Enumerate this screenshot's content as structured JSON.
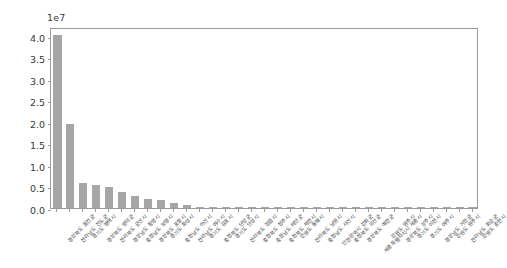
{
  "chart_data": {
    "type": "bar",
    "title": "",
    "xlabel": "",
    "ylabel": "",
    "offset_text": "1e7",
    "scale_factor": 10000000,
    "ylim": [
      0.0,
      4.2
    ],
    "ytick_labels": [
      "0.0",
      "0.5",
      "1.0",
      "1.5",
      "2.0",
      "2.5",
      "3.0",
      "3.5",
      "4.0"
    ],
    "ytick_values": [
      0.0,
      0.5,
      1.0,
      1.5,
      2.0,
      2.5,
      3.0,
      3.5,
      4.0
    ],
    "grid": false,
    "legend": null,
    "bar_color": "#a6a6a6",
    "frame_color": "#9a9a9a",
    "tick_label_color": "#3a3a3a",
    "xtick_rotation": -45,
    "categories": [
      "경상북도 울진군",
      "전라남도 진도군",
      "경기도 평택시",
      "경상북도 영덕군",
      "전라북도 군산시",
      "경상남도 통영시",
      "충청남도 보령시",
      "경상북도 포항시",
      "경기도 화성시",
      "충청남도 아산시",
      "전라남도 여수시",
      "경기도 김포시",
      "충청북도 단양군",
      "경기도 안성시",
      "전라북도 정읍시",
      "충청북도 청주시",
      "충청남도 태안군",
      "충청북도 제천시",
      "강원도 동해시",
      "전라북도 남원시",
      "충청남도 서산시",
      "인천광역시 강화군",
      "충청북도 괴산군",
      "경상북도 예천군",
      "세종특별자치시 세종시",
      "강원도 원주시",
      "경상북도 상주시",
      "경기도 이천시",
      "경기도 여주시",
      "경상남도 거창군",
      "강원도 원주시",
      "전라남도 화순군",
      "강원도 춘천시"
    ],
    "values": [
      4.02,
      1.95,
      0.59,
      0.545,
      0.485,
      0.375,
      0.285,
      0.215,
      0.195,
      0.11,
      0.065,
      0.022,
      0.018,
      0.016,
      0.015,
      0.014,
      0.013,
      0.013,
      0.012,
      0.012,
      0.011,
      0.011,
      0.01,
      0.01,
      0.01,
      0.009,
      0.009,
      0.008,
      0.008,
      0.007,
      0.006,
      0.005,
      0.004
    ]
  }
}
